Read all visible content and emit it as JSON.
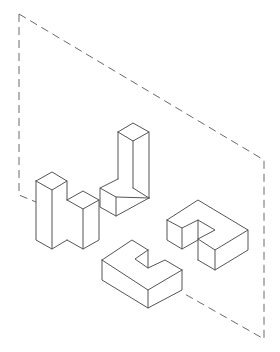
{
  "figure": {
    "width": 280,
    "height": 352,
    "colors": {
      "background": "#ffffff",
      "line": "#555555",
      "plane_line": "#6a6a6a"
    },
    "plane": {
      "style": "dashed",
      "points": "19,14 264,160 264,339 183,293",
      "left_edge": "19,14 19,195 36,202"
    },
    "shapes": [
      {
        "name": "L-block-left",
        "faces": [
          "36,181 52,172 67,181 52,190",
          "36,181 52,190 52,249 36,240",
          "52,190 67,181 67,240 52,249",
          "67,200 83,191 99,200 83,209 67,200",
          "67,200 83,209 83,249 67,240",
          "83,209 99,200 99,240 83,249"
        ],
        "edges": [
          "36,181 52,172 67,181 52,190 36,181",
          "36,181 36,240 52,249 52,190",
          "67,181 67,200",
          "67,200 83,191 99,200 83,209 67,200",
          "83,209 83,249",
          "99,200 99,240 83,249 67,240",
          "52,249 67,240"
        ]
      },
      {
        "name": "L-block-tall",
        "faces": [
          "118,132 133,123 149,132 133,141",
          "118,132 133,141 133,188 118,179",
          "133,141 149,132 149,198 133,207 133,188",
          "100,188 116,179 133,188 149,198 133,207 116,197",
          "100,188 116,197 116,216 100,207",
          "116,197 149,198 149,216 116,216"
        ],
        "edges": [
          "118,132 133,123 149,132 133,141 118,132",
          "118,132 118,179",
          "133,141 133,188",
          "149,132 149,198",
          "118,179 100,188 116,197 149,198",
          "100,188 100,207 116,216 149,198",
          "116,197 116,216",
          "133,188 149,198"
        ]
      },
      {
        "name": "C-block",
        "faces": [
          "102,260 132,240 148,250 135,259 148,268 165,260 182,270 148,290",
          "102,260 148,290 148,308 102,280",
          "148,290 182,270 182,290 148,308",
          "135,259 148,250 148,268"
        ],
        "edges": [
          "102,260 132,240 148,250",
          "148,250 135,259 148,268 165,260 182,270",
          "148,250 148,268",
          "102,260 148,290 182,270",
          "102,260 102,280 148,308 182,290 182,270",
          "148,290 148,308"
        ]
      },
      {
        "name": "G-block",
        "faces": [
          "167,220 198,200 248,230 215,250 198,239 198,220 182,228",
          "167,220 182,228 182,249 167,240",
          "182,228 198,220 198,240 182,249",
          "198,239 215,250 215,270 198,260",
          "215,250 248,230 248,250 215,270",
          "198,220 215,230 198,239"
        ],
        "edges": [
          "167,220 198,200 248,230 215,250 198,239",
          "167,220 182,228 198,220 215,230 198,239",
          "198,220 198,260",
          "167,220 167,240 182,249 198,240",
          "182,228 182,249",
          "198,260 215,270 248,250 248,230",
          "215,250 215,270"
        ]
      }
    ]
  }
}
